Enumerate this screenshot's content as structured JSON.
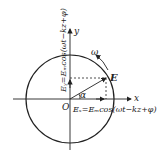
{
  "diagram": {
    "type": "circular-polarization-vector",
    "axes": {
      "x_label": "x",
      "y_label": "y",
      "origin_label": "O"
    },
    "vector_label": "E",
    "angle_label": "α",
    "rotation_label": "ω",
    "ex_equation": "Eₓ=Eₘcos(ωt−kz+φ)",
    "ey_equation": "Eᵧ=Eₘcos(ωt−kz+φ)",
    "colors": {
      "stroke": "#222222",
      "background": "#ffffff"
    }
  }
}
